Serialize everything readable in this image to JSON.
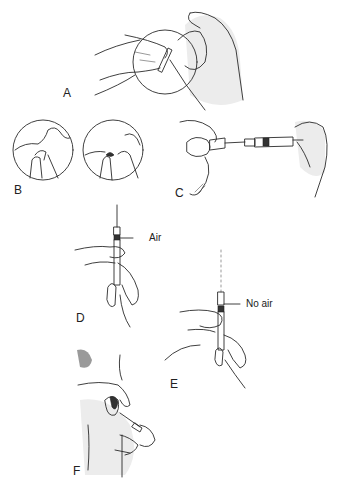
{
  "figure": {
    "panels": [
      {
        "id": "A",
        "label": "A",
        "description": "Hands pinching tubing/cap inside magnified circle"
      },
      {
        "id": "B",
        "label": "B",
        "description": "Two magnified circles showing cap removal"
      },
      {
        "id": "C",
        "label": "C",
        "description": "Syringe needle inserted into vial held between fingers"
      },
      {
        "id": "D",
        "label": "D",
        "description": "Syringe held upright with air bubble",
        "annotation": "Air"
      },
      {
        "id": "E",
        "label": "E",
        "description": "Syringe held upright after expelling air",
        "annotation": "No air"
      },
      {
        "id": "F",
        "label": "F",
        "description": "Injection into skin fold of upper arm/torso"
      }
    ]
  },
  "colors": {
    "line": "#2a2a2a",
    "shade": "#ececec",
    "background": "#ffffff",
    "hair": "#9a9a9a"
  }
}
